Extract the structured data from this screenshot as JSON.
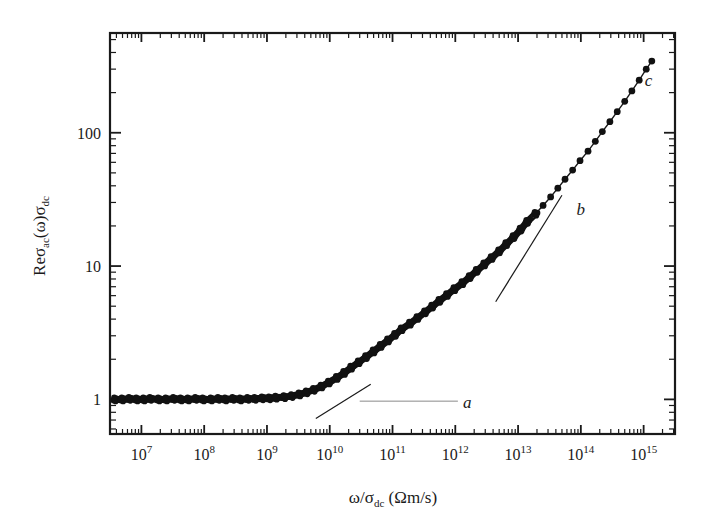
{
  "figure": {
    "background_color": "#ffffff",
    "ink_color": "#1a1a1a"
  },
  "chart_data": {
    "type": "scatter",
    "title": "",
    "subtitle": "",
    "xlabel": "ω/σ_dc (Ωm/s)",
    "ylabel": "Reσ_ac(ω)σ_dc",
    "xlabel_parts": {
      "omega": "ω",
      "slash": "/",
      "sigma": "σ",
      "sigma_sub": "dc",
      "units": "(Ωm/s)"
    },
    "ylabel_parts": {
      "re": "Re",
      "sigma1": "σ",
      "sigma1_sub": "ac",
      "omega": "(ω)",
      "sigma2": "σ",
      "sigma2_sub": "dc"
    },
    "xscale": "log",
    "yscale": "log",
    "xlim": [
      3160000.0,
      3160000000000000.0
    ],
    "ylim": [
      0.55,
      560
    ],
    "grid": false,
    "legend": null,
    "xticks": [
      10000000.0,
      100000000.0,
      1000000000.0,
      10000000000.0,
      100000000000.0,
      1000000000000.0,
      10000000000000.0,
      100000000000000.0,
      1000000000000000.0
    ],
    "xtick_labels": [
      "10⁷",
      "10⁸",
      "10⁹",
      "10¹⁰",
      "10¹¹",
      "10¹²",
      "10¹³",
      "10¹⁴",
      "10¹⁵"
    ],
    "xtick_mantissa": [
      "10",
      "10",
      "10",
      "10",
      "10",
      "10",
      "10",
      "10",
      "10"
    ],
    "xtick_exponents": [
      "7",
      "8",
      "9",
      "10",
      "11",
      "12",
      "13",
      "14",
      "15"
    ],
    "yticks": [
      1,
      10,
      100
    ],
    "ytick_labels": [
      "1",
      "10",
      "100"
    ],
    "minor_ticks": true,
    "tick_direction": "in",
    "marker": "filled-circle",
    "marker_color": "#111111",
    "points": [
      {
        "x": 3800000.0,
        "y": 1.0
      },
      {
        "x": 5000000.0,
        "y": 1.0
      },
      {
        "x": 6500000.0,
        "y": 1.01
      },
      {
        "x": 8500000.0,
        "y": 1.0
      },
      {
        "x": 11000000.0,
        "y": 1.0
      },
      {
        "x": 14000000.0,
        "y": 1.01
      },
      {
        "x": 19000000.0,
        "y": 1.0
      },
      {
        "x": 25000000.0,
        "y": 1.0
      },
      {
        "x": 33000000.0,
        "y": 1.01
      },
      {
        "x": 43000000.0,
        "y": 1.0
      },
      {
        "x": 56000000.0,
        "y": 1.0
      },
      {
        "x": 74000000.0,
        "y": 1.01
      },
      {
        "x": 97000000.0,
        "y": 1.0
      },
      {
        "x": 130000000.0,
        "y": 1.0
      },
      {
        "x": 170000000.0,
        "y": 1.01
      },
      {
        "x": 220000000.0,
        "y": 1.0
      },
      {
        "x": 290000000.0,
        "y": 1.01
      },
      {
        "x": 380000000.0,
        "y": 1.0
      },
      {
        "x": 500000000.0,
        "y": 1.01
      },
      {
        "x": 650000000.0,
        "y": 1.01
      },
      {
        "x": 850000000.0,
        "y": 1.02
      },
      {
        "x": 1100000000.0,
        "y": 1.02
      },
      {
        "x": 1400000000.0,
        "y": 1.03
      },
      {
        "x": 1900000000.0,
        "y": 1.04
      },
      {
        "x": 2500000000.0,
        "y": 1.06
      },
      {
        "x": 3300000000.0,
        "y": 1.09
      },
      {
        "x": 4300000000.0,
        "y": 1.13
      },
      {
        "x": 5600000000.0,
        "y": 1.18
      },
      {
        "x": 7400000000.0,
        "y": 1.25
      },
      {
        "x": 9700000000.0,
        "y": 1.34
      },
      {
        "x": 13000000000.0,
        "y": 1.45
      },
      {
        "x": 17000000000.0,
        "y": 1.58
      },
      {
        "x": 22000000000.0,
        "y": 1.73
      },
      {
        "x": 29000000000.0,
        "y": 1.9
      },
      {
        "x": 38000000000.0,
        "y": 2.08
      },
      {
        "x": 50000000000.0,
        "y": 2.29
      },
      {
        "x": 65000000000.0,
        "y": 2.52
      },
      {
        "x": 85000000000.0,
        "y": 2.77
      },
      {
        "x": 110000000000.0,
        "y": 3.05
      },
      {
        "x": 140000000000.0,
        "y": 3.36
      },
      {
        "x": 190000000000.0,
        "y": 3.7
      },
      {
        "x": 250000000000.0,
        "y": 4.08
      },
      {
        "x": 330000000000.0,
        "y": 4.5
      },
      {
        "x": 430000000000.0,
        "y": 4.97
      },
      {
        "x": 560000000000.0,
        "y": 5.49
      },
      {
        "x": 740000000000.0,
        "y": 6.07
      },
      {
        "x": 970000000000.0,
        "y": 6.72
      },
      {
        "x": 1300000000000.0,
        "y": 7.45
      },
      {
        "x": 1700000000000.0,
        "y": 8.28
      },
      {
        "x": 2200000000000.0,
        "y": 9.22
      },
      {
        "x": 2900000000000.0,
        "y": 10.3
      },
      {
        "x": 3800000000000.0,
        "y": 11.5
      },
      {
        "x": 5000000000000.0,
        "y": 12.9
      },
      {
        "x": 6500000000000.0,
        "y": 14.6
      },
      {
        "x": 8500000000000.0,
        "y": 16.5
      },
      {
        "x": 11000000000000.0,
        "y": 18.8
      },
      {
        "x": 14000000000000.0,
        "y": 21.5
      },
      {
        "x": 19000000000000.0,
        "y": 24.7
      },
      {
        "x": 25000000000000.0,
        "y": 28.5
      },
      {
        "x": 33000000000000.0,
        "y": 33.0
      },
      {
        "x": 43000000000000.0,
        "y": 38.4
      },
      {
        "x": 56000000000000.0,
        "y": 44.8
      },
      {
        "x": 74000000000000.0,
        "y": 52.5
      },
      {
        "x": 97000000000000.0,
        "y": 61.7
      },
      {
        "x": 130000000000000.0,
        "y": 72.8
      },
      {
        "x": 170000000000000.0,
        "y": 86.2
      },
      {
        "x": 220000000000000.0,
        "y": 102
      },
      {
        "x": 290000000000000.0,
        "y": 121
      },
      {
        "x": 380000000000000.0,
        "y": 144
      },
      {
        "x": 500000000000000.0,
        "y": 172
      },
      {
        "x": 650000000000000.0,
        "y": 206
      },
      {
        "x": 850000000000000.0,
        "y": 248
      },
      {
        "x": 1100000000000000.0,
        "y": 300
      },
      {
        "x": 1350000000000000.0,
        "y": 345
      }
    ],
    "annotations": [
      {
        "label": "a",
        "style": "italic",
        "x": 1550000000000.0,
        "y": 0.96,
        "leader": {
          "from_x": 30000000000.0,
          "from_y": 0.97,
          "to_x": 1100000000000.0,
          "to_y": 0.97
        },
        "tangent": {
          "from_x": 6000000000.0,
          "from_y": 0.72,
          "to_x": 45000000000.0,
          "to_y": 1.3
        }
      },
      {
        "label": "b",
        "style": "italic",
        "x": 100000000000000.0,
        "y": 27.0,
        "tangent": {
          "from_x": 4400000000000.0,
          "from_y": 5.4,
          "to_x": 50000000000000.0,
          "to_y": 34.0
        }
      },
      {
        "label": "c",
        "style": "italic",
        "x": 1200000000000000.0,
        "y": 250.0
      }
    ],
    "fit_line": {
      "label": "guide to the eye",
      "from_x": 20000000000000.0,
      "from_y": 22.0,
      "to_x": 1600000000000000.0,
      "to_y": 400.0
    }
  },
  "axes": {
    "plot_left_px": 110,
    "plot_right_px": 675,
    "plot_top_px": 33,
    "plot_bottom_px": 434,
    "frame_visible": true,
    "frame_color": "#1a1a1a"
  }
}
